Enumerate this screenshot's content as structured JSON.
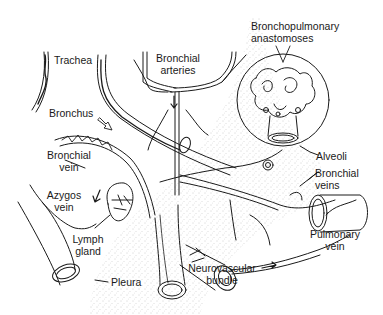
{
  "diagram": {
    "labels": {
      "trachea": "Trachea",
      "bronchial_arteries_1": "Bronchial",
      "bronchial_arteries_2": "arteries",
      "bronchopulmonary_1": "Bronchopulmonary",
      "bronchopulmonary_2": "anastomoses",
      "bronchus": "Bronchus",
      "bronchial_vein_1": "Bronchial",
      "bronchial_vein_2": "vein",
      "azygos_1": "Azygos",
      "azygos_2": "vein",
      "alveoli": "Alveoli",
      "bronchial_veins_1": "Bronchial",
      "bronchial_veins_2": "veins",
      "lymph_1": "Lymph",
      "lymph_2": "gland",
      "pulmonary_vein_1": "Pulmonary",
      "pulmonary_vein_2": "vein",
      "neurovascular_1": "Neurovascular",
      "neurovascular_2": "bundle",
      "pleura": "Pleura"
    },
    "colors": {
      "ink": "#1a1a1a",
      "background": "#ffffff",
      "stipple": "#9a9a9a"
    }
  }
}
